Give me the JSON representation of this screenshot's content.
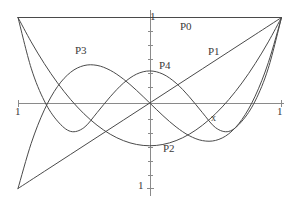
{
  "chart_data": {
    "type": "line",
    "title": "",
    "subtitle": "",
    "xlabel": "x",
    "ylabel": "",
    "xlim": [
      -1,
      1
    ],
    "ylim": [
      -1,
      1
    ],
    "grid": false,
    "legend_position": "inline-annotations",
    "axis_ticks": {
      "x": [
        -1,
        1
      ],
      "y": [
        -1,
        1
      ],
      "x_tick_labels": [
        "1",
        "1"
      ],
      "y_tick_labels": [
        "1",
        "1"
      ],
      "minor_ticks_on_y_axis": true
    },
    "series": [
      {
        "name": "P0",
        "label": "P0",
        "formula": "1",
        "color": "#4a4a4a",
        "points": [
          [
            -1,
            1
          ],
          [
            1,
            1
          ]
        ]
      },
      {
        "name": "P1",
        "label": "P1",
        "formula": "x",
        "color": "#4a4a4a",
        "points": [
          [
            -1,
            -1
          ],
          [
            -0.8,
            -0.8
          ],
          [
            -0.6,
            -0.6
          ],
          [
            -0.4,
            -0.4
          ],
          [
            -0.2,
            -0.2
          ],
          [
            0,
            0
          ],
          [
            0.2,
            0.2
          ],
          [
            0.4,
            0.4
          ],
          [
            0.6,
            0.6
          ],
          [
            0.8,
            0.8
          ],
          [
            1,
            1
          ]
        ]
      },
      {
        "name": "P2",
        "label": "P2",
        "formula": "(3x^2 - 1)/2",
        "color": "#4a4a4a",
        "points": [
          [
            -1,
            1
          ],
          [
            -0.9,
            0.715
          ],
          [
            -0.8,
            0.46
          ],
          [
            -0.7,
            0.235
          ],
          [
            -0.6,
            0.04
          ],
          [
            -0.5,
            -0.125
          ],
          [
            -0.4,
            -0.26
          ],
          [
            -0.3,
            -0.365
          ],
          [
            -0.2,
            -0.44
          ],
          [
            -0.1,
            -0.485
          ],
          [
            0,
            -0.5
          ],
          [
            0.1,
            -0.485
          ],
          [
            0.2,
            -0.44
          ],
          [
            0.3,
            -0.365
          ],
          [
            0.4,
            -0.26
          ],
          [
            0.5,
            -0.125
          ],
          [
            0.6,
            0.04
          ],
          [
            0.7,
            0.235
          ],
          [
            0.8,
            0.46
          ],
          [
            0.9,
            0.715
          ],
          [
            1,
            1
          ]
        ]
      },
      {
        "name": "P3",
        "label": "P3",
        "formula": "(5x^3 - 3x)/2",
        "color": "#4a4a4a",
        "points": [
          [
            -1,
            -1
          ],
          [
            -0.9,
            -0.4725
          ],
          [
            -0.8,
            -0.08
          ],
          [
            -0.7,
            0.1925
          ],
          [
            -0.6,
            0.36
          ],
          [
            -0.5,
            0.4375
          ],
          [
            -0.4,
            0.44
          ],
          [
            -0.3,
            0.3825
          ],
          [
            -0.2,
            0.28
          ],
          [
            -0.1,
            0.1475
          ],
          [
            0,
            0
          ],
          [
            0.1,
            -0.1475
          ],
          [
            0.2,
            -0.28
          ],
          [
            0.3,
            -0.3825
          ],
          [
            0.4,
            -0.44
          ],
          [
            0.5,
            -0.4375
          ],
          [
            0.6,
            -0.36
          ],
          [
            0.7,
            -0.1925
          ],
          [
            0.8,
            0.08
          ],
          [
            0.9,
            0.4725
          ],
          [
            1,
            1
          ]
        ]
      },
      {
        "name": "P4",
        "label": "P4",
        "formula": "(35x^4 - 30x^2 + 3)/8",
        "color": "#4a4a4a",
        "points": [
          [
            -1,
            1
          ],
          [
            -0.9,
            0.4072
          ],
          [
            -0.8,
            0.0232
          ],
          [
            -0.7,
            -0.212
          ],
          [
            -0.6,
            -0.3324
          ],
          [
            -0.5,
            -0.2891
          ],
          [
            -0.4,
            -0.113
          ],
          [
            -0.3,
            0.0729
          ],
          [
            -0.2,
            0.232
          ],
          [
            -0.1,
            0.3379
          ],
          [
            0,
            0.375
          ],
          [
            0.1,
            0.3379
          ],
          [
            0.2,
            0.232
          ],
          [
            0.3,
            0.0729
          ],
          [
            0.4,
            -0.113
          ],
          [
            0.5,
            -0.2891
          ],
          [
            0.6,
            -0.3324
          ],
          [
            0.7,
            -0.212
          ],
          [
            0.8,
            0.0232
          ],
          [
            0.9,
            0.4072
          ],
          [
            1,
            1
          ]
        ]
      }
    ],
    "annotations": [
      {
        "text": "P0",
        "x": 0.23,
        "y": 0.86
      },
      {
        "text": "P1",
        "x": 0.45,
        "y": 0.58
      },
      {
        "text": "P2",
        "x": 0.11,
        "y": -0.51
      },
      {
        "text": "P3",
        "x": -0.57,
        "y": 0.57
      },
      {
        "text": "P4",
        "x": 0.08,
        "y": 0.43
      },
      {
        "text": "x",
        "x": 0.48,
        "y": -0.16
      }
    ]
  },
  "labels": {
    "p0": "P0",
    "p1": "P1",
    "p2": "P2",
    "p3": "P3",
    "p4": "P4",
    "x_var": "x",
    "y_top": "1",
    "y_bottom": "1",
    "x_left": "1",
    "x_right": "1"
  },
  "colors": {
    "background": "#ffffff",
    "curve": "#4a4a4a",
    "axis": "#8a8a8a",
    "text": "#3a3a3a"
  }
}
